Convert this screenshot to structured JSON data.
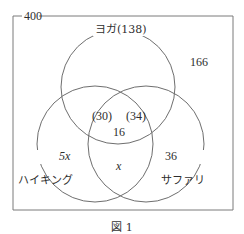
{
  "diagram": {
    "type": "venn",
    "universe": {
      "label": "400",
      "value": 400
    },
    "outside": {
      "label": "166",
      "value": 166
    },
    "sets": [
      {
        "id": "yoga",
        "label": "ヨガ(138)",
        "name": "ヨガ",
        "total": 138
      },
      {
        "id": "hiking",
        "label": "ハイキング",
        "name": "ハイキング"
      },
      {
        "id": "safari",
        "label": "サファリ",
        "name": "サファリ"
      }
    ],
    "regions": {
      "yoga_hiking": "(30)",
      "yoga_safari": "(34)",
      "all_three": "16",
      "hiking_only": "5x",
      "hiking_safari_only": "x",
      "safari_only": "36"
    },
    "caption": "図 1",
    "colors": {
      "stroke": "#6e6e6e",
      "text": "#2e2e2e",
      "background": "#ffffff"
    }
  }
}
